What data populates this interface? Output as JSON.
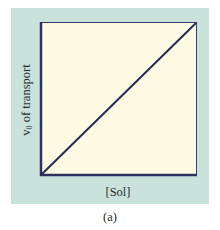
{
  "chart_data": {
    "type": "line",
    "title": "",
    "xlabel": "[Sol]",
    "ylabel": "v0 of transport",
    "ylabel_parts": {
      "base": "v",
      "subscript": "0",
      "rest": " of transport"
    },
    "caption": "(a)",
    "x": [
      0,
      1
    ],
    "series": [
      {
        "name": "v0 of transport",
        "values": [
          0,
          1
        ],
        "color": "#262b55"
      }
    ],
    "xlim": [
      0,
      1
    ],
    "ylim": [
      0,
      1
    ],
    "xticks": [],
    "yticks": [],
    "grid": false,
    "legend": null
  },
  "colors": {
    "panel_background": "#c9e3dc",
    "plot_background": "#fdfbe4",
    "axis": "#2e3160",
    "line": "#262b55",
    "text": "#2a2a2a"
  }
}
